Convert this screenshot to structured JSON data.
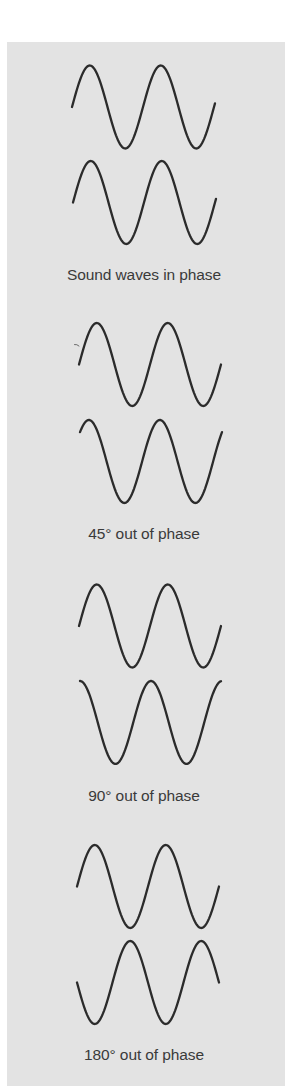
{
  "figure": {
    "background_color": "#e3e3e3",
    "stroke_color": "#2b2b2b",
    "text_color": "#3a3a3a",
    "wave_period_px": 71,
    "wave_amplitude_px": 41.5,
    "sections": [
      {
        "id": "in-phase",
        "caption": "Sound waves in phase",
        "caption_top": 266,
        "phase_difference_deg": 0,
        "waves": [
          {
            "x_start": 72,
            "x_end": 215,
            "center_y": 107,
            "phase_deg": 0
          },
          {
            "x_start": 73,
            "x_end": 216,
            "center_y": 202.5,
            "phase_deg": 0
          }
        ]
      },
      {
        "id": "45-out-of-phase",
        "caption": "45° out of phase",
        "caption_top": 525,
        "phase_difference_deg": 45,
        "waves": [
          {
            "x_start": 79,
            "x_end": 221,
            "center_y": 364.5,
            "phase_deg": 0
          },
          {
            "x_start": 80,
            "x_end": 222,
            "center_y": 461.5,
            "phase_deg": 45
          }
        ]
      },
      {
        "id": "90-out-of-phase",
        "caption": "90° out of phase",
        "caption_top": 787,
        "phase_difference_deg": 90,
        "waves": [
          {
            "x_start": 79,
            "x_end": 221,
            "center_y": 626,
            "phase_deg": 0
          },
          {
            "x_start": 80,
            "x_end": 221,
            "center_y": 722.5,
            "phase_deg": 90
          }
        ]
      },
      {
        "id": "180-out-of-phase",
        "caption": "180° out of phase",
        "caption_top": 1046,
        "phase_difference_deg": 180,
        "waves": [
          {
            "x_start": 77,
            "x_end": 219,
            "center_y": 886.5,
            "phase_deg": 0
          },
          {
            "x_start": 77,
            "x_end": 219,
            "center_y": 982.5,
            "phase_deg": 180
          }
        ]
      }
    ]
  }
}
